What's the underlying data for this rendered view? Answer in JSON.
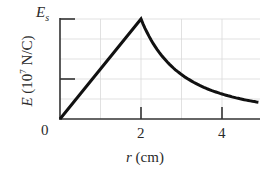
{
  "chart_data": {
    "type": "line",
    "title": "",
    "xlabel": "r (cm)",
    "xlabel_var": "r",
    "xlabel_unit": "(cm)",
    "ylabel": "E (10^7 N/C)",
    "ylabel_var": "E",
    "ylabel_unit_prefix": "(10",
    "ylabel_unit_exp": "7",
    "ylabel_unit_suffix": " N/C)",
    "x_ticks": [
      "0",
      "2",
      "4"
    ],
    "y_tick_top_label": "E",
    "y_tick_top_sub": "s",
    "xlim": [
      0,
      4.94
    ],
    "ylim": [
      0,
      1
    ],
    "grid": true,
    "legend": null,
    "series": [
      {
        "name": "E(r)",
        "description": "Linear rise from 0 to E_s at r = 2 cm, then decays as 1/r^2",
        "x": [
          0,
          1,
          2,
          2.5,
          3,
          3.5,
          4,
          4.5,
          4.94
        ],
        "values": [
          0,
          0.5,
          1.0,
          0.64,
          0.444,
          0.327,
          0.25,
          0.198,
          0.164
        ]
      }
    ],
    "annotations": [
      "E_s marks the maximum field at r = 2 cm",
      "Mid y-axis tick at 0.4 E_s"
    ]
  }
}
